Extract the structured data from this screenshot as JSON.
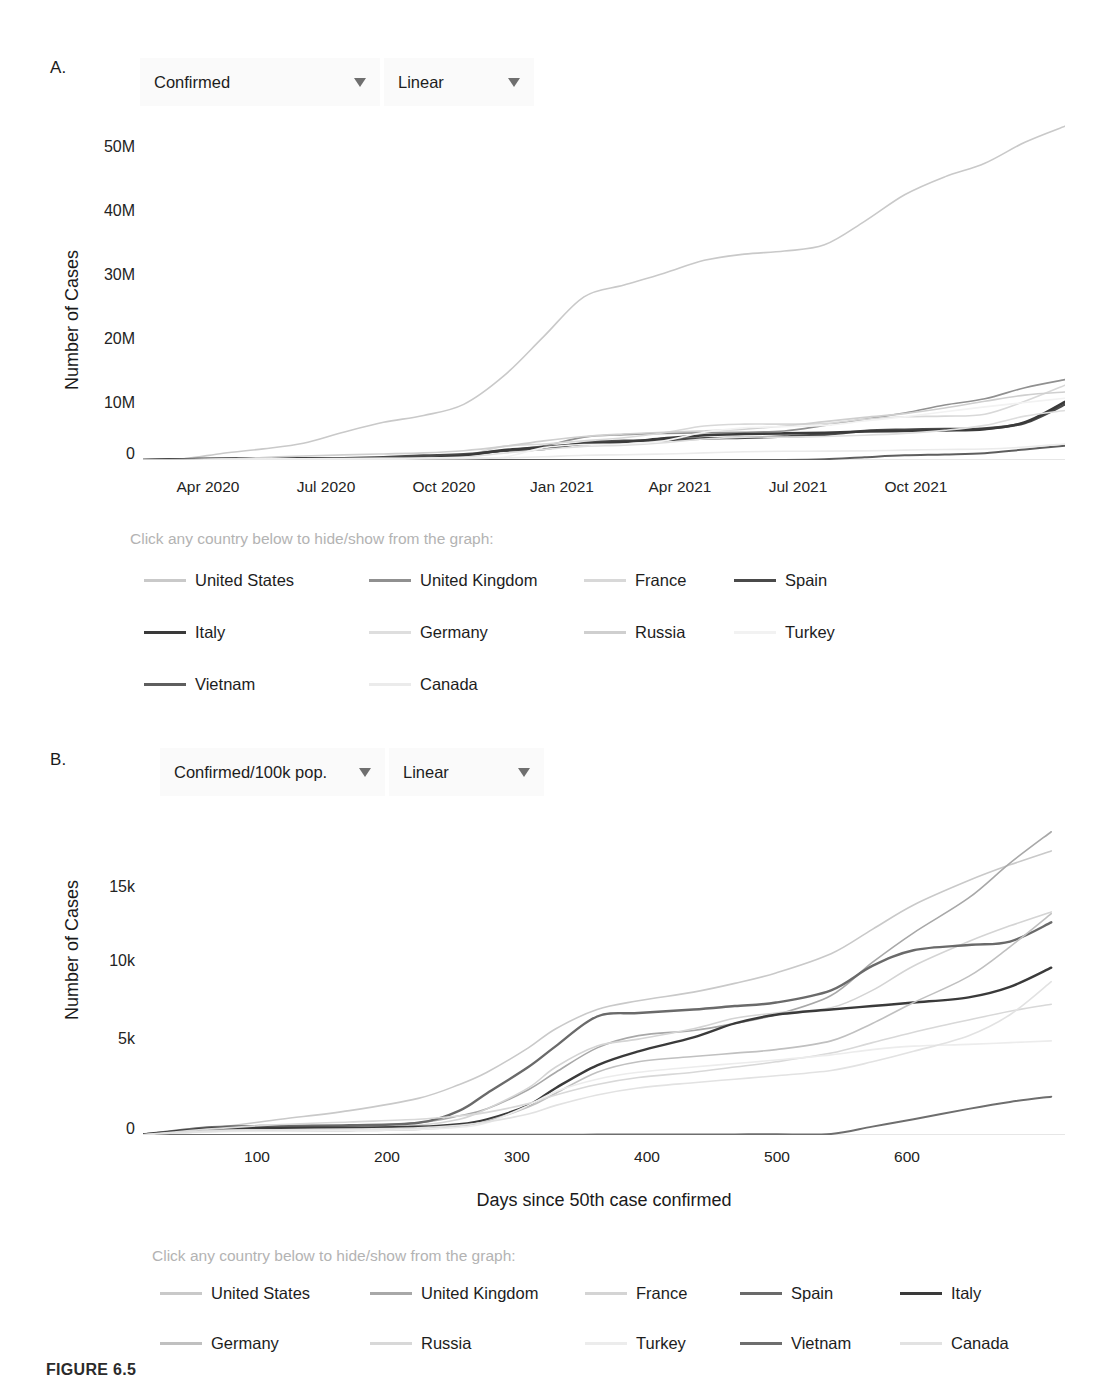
{
  "figure": {
    "caption": "FIGURE 6.5"
  },
  "panel_a": {
    "letter": "A.",
    "controls": [
      {
        "name": "metric-dropdown",
        "value": "Confirmed",
        "caret": "chevron-down-icon"
      },
      {
        "name": "scale-dropdown",
        "value": "Linear",
        "caret": "chevron-down-icon"
      }
    ],
    "legend_hint": "Click any country below to hide/show from the graph:",
    "legend": [
      {
        "label": "United States",
        "color": "#c9c9c9"
      },
      {
        "label": "United Kingdom",
        "color": "#909090"
      },
      {
        "label": "France",
        "color": "#d8d8d8"
      },
      {
        "label": "Spain",
        "color": "#4a4a4a"
      },
      {
        "label": "Italy",
        "color": "#3a3a3a"
      },
      {
        "label": "Germany",
        "color": "#dedede"
      },
      {
        "label": "Russia",
        "color": "#cfcfcf"
      },
      {
        "label": "Turkey",
        "color": "#f2f2f2"
      },
      {
        "label": "Vietnam",
        "color": "#5e5e5e"
      },
      {
        "label": "Canada",
        "color": "#ebebeb"
      }
    ]
  },
  "panel_b": {
    "letter": "B.",
    "controls": [
      {
        "name": "metric-dropdown",
        "value": "Confirmed/100k pop.",
        "caret": "chevron-down-icon"
      },
      {
        "name": "scale-dropdown",
        "value": "Linear",
        "caret": "chevron-down-icon"
      }
    ],
    "legend_hint": "Click any country below to hide/show from the graph:",
    "legend": [
      {
        "label": "United States",
        "color": "#c9c9c9"
      },
      {
        "label": "United Kingdom",
        "color": "#a8a8a8"
      },
      {
        "label": "France",
        "color": "#d4d4d4"
      },
      {
        "label": "Spain",
        "color": "#6a6a6a"
      },
      {
        "label": "Italy",
        "color": "#3a3a3a"
      },
      {
        "label": "Germany",
        "color": "#c0c0c0"
      },
      {
        "label": "Russia",
        "color": "#d8d8d8"
      },
      {
        "label": "Turkey",
        "color": "#ececec"
      },
      {
        "label": "Vietnam",
        "color": "#6e6e6e"
      },
      {
        "label": "Canada",
        "color": "#e2e2e2"
      }
    ]
  },
  "chart_data": [
    {
      "id": "chart-a",
      "type": "line",
      "title": "",
      "xlabel": "",
      "ylabel": "Number of Cases",
      "metric": "Confirmed",
      "scale": "Linear",
      "grid": false,
      "legend_position": "below",
      "xticks": [
        "Apr 2020",
        "Jul 2020",
        "Oct 2020",
        "Jan 2021",
        "Apr 2021",
        "Jul 2021",
        "Oct 2021"
      ],
      "yticks": [
        "0",
        "10M",
        "20M",
        "30M",
        "40M",
        "50M"
      ],
      "ylim": [
        0,
        55000000
      ],
      "x": [
        0,
        1,
        2,
        3,
        4,
        5,
        6,
        7,
        8,
        9,
        10,
        11,
        12,
        13,
        14,
        15,
        16,
        17,
        18,
        19,
        20,
        21,
        22,
        23
      ],
      "x_labels": [
        "Feb 2020",
        "Mar 2020",
        "Apr 2020",
        "May 2020",
        "Jun 2020",
        "Jul 2020",
        "Aug 2020",
        "Sep 2020",
        "Oct 2020",
        "Nov 2020",
        "Dec 2020",
        "Jan 2021",
        "Feb 2021",
        "Mar 2021",
        "Apr 2021",
        "May 2021",
        "Jun 2021",
        "Jul 2021",
        "Aug 2021",
        "Sep 2021",
        "Oct 2021",
        "Nov 2021",
        "Dec 2021",
        "Jan 2022"
      ],
      "series": [
        {
          "name": "United States",
          "color": "#c9c9c9",
          "width": 1.6,
          "values": [
            0.02,
            0.18,
            1.1,
            1.8,
            2.7,
            4.5,
            6.1,
            7.2,
            9.0,
            13.6,
            20.0,
            26.4,
            28.3,
            30.2,
            32.3,
            33.3,
            33.8,
            34.8,
            38.6,
            42.9,
            45.8,
            48.0,
            51.4,
            54.0
          ]
        },
        {
          "name": "United Kingdom",
          "color": "#909090",
          "width": 1.6,
          "values": [
            0.0,
            0.03,
            0.17,
            0.27,
            0.31,
            0.3,
            0.34,
            0.41,
            0.67,
            1.5,
            2.3,
            3.7,
            4.1,
            4.3,
            4.4,
            4.5,
            4.7,
            5.6,
            6.6,
            7.6,
            8.9,
            9.9,
            11.7,
            13.0
          ]
        },
        {
          "name": "France",
          "color": "#d8d8d8",
          "width": 1.6,
          "values": [
            0.0,
            0.04,
            0.13,
            0.15,
            0.2,
            0.21,
            0.3,
            0.56,
            0.75,
            2.2,
            2.6,
            3.1,
            3.6,
            4.4,
            5.5,
            5.8,
            5.8,
            5.9,
            6.6,
            7.0,
            7.1,
            7.4,
            9.5,
            12.1
          ]
        },
        {
          "name": "Spain",
          "color": "#4a4a4a",
          "width": 2.6,
          "values": [
            0.0,
            0.09,
            0.21,
            0.24,
            0.25,
            0.29,
            0.45,
            0.7,
            0.93,
            1.5,
            1.8,
            2.7,
            3.1,
            3.2,
            3.5,
            3.6,
            3.8,
            4.1,
            4.7,
            4.9,
            5.0,
            5.1,
            6.0,
            9.0
          ]
        },
        {
          "name": "Italy",
          "color": "#3a3a3a",
          "width": 2.6,
          "values": [
            0.0,
            0.1,
            0.2,
            0.23,
            0.24,
            0.25,
            0.27,
            0.32,
            0.73,
            1.6,
            2.1,
            2.6,
            2.9,
            3.5,
            4.0,
            4.2,
            4.3,
            4.4,
            4.6,
            4.7,
            4.8,
            5.0,
            6.1,
            9.4
          ]
        },
        {
          "name": "Germany",
          "color": "#dedede",
          "width": 1.6,
          "values": [
            0.0,
            0.06,
            0.16,
            0.18,
            0.19,
            0.21,
            0.24,
            0.28,
            0.46,
            1.1,
            1.7,
            2.2,
            2.4,
            2.8,
            3.4,
            3.7,
            3.7,
            3.8,
            4.0,
            4.3,
            4.8,
            5.6,
            7.1,
            8.0
          ]
        },
        {
          "name": "Russia",
          "color": "#cfcfcf",
          "width": 1.6,
          "values": [
            0.0,
            0.002,
            0.11,
            0.41,
            0.65,
            0.83,
            0.98,
            1.15,
            1.5,
            2.2,
            3.1,
            3.8,
            4.2,
            4.5,
            4.7,
            5.0,
            5.5,
            6.2,
            6.9,
            7.5,
            8.4,
            9.5,
            10.5,
            11.0
          ]
        },
        {
          "name": "Turkey",
          "color": "#f2f2f2",
          "width": 1.6,
          "values": [
            0.0,
            0.01,
            0.12,
            0.16,
            0.2,
            0.23,
            0.26,
            0.31,
            0.37,
            0.45,
            2.0,
            2.5,
            2.6,
            3.1,
            4.5,
            5.2,
            5.4,
            5.6,
            6.3,
            7.0,
            7.8,
            8.6,
            9.3,
            10.0
          ]
        },
        {
          "name": "Vietnam",
          "color": "#5e5e5e",
          "width": 2.0,
          "values": [
            0.0,
            0.0,
            0.0003,
            0.0003,
            0.0004,
            0.0004,
            0.001,
            0.001,
            0.001,
            0.0013,
            0.0015,
            0.0018,
            0.0024,
            0.0026,
            0.003,
            0.007,
            0.017,
            0.13,
            0.45,
            0.75,
            0.9,
            1.1,
            1.7,
            2.3
          ]
        },
        {
          "name": "Canada",
          "color": "#ebebeb",
          "width": 1.6,
          "values": [
            0.0,
            0.009,
            0.055,
            0.09,
            0.105,
            0.117,
            0.13,
            0.15,
            0.21,
            0.33,
            0.53,
            0.77,
            0.86,
            0.97,
            1.15,
            1.33,
            1.41,
            1.43,
            1.47,
            1.6,
            1.7,
            1.78,
            2.1,
            2.6
          ]
        }
      ],
      "value_units": "millions"
    },
    {
      "id": "chart-b",
      "type": "line",
      "title": "",
      "xlabel": "Days since 50th case confirmed",
      "ylabel": "Number of Cases",
      "metric": "Confirmed/100k pop.",
      "scale": "Linear",
      "grid": false,
      "legend_position": "below",
      "xticks": [
        "100",
        "200",
        "300",
        "400",
        "500",
        "600"
      ],
      "yticks": [
        "0",
        "5k",
        "10k",
        "15k"
      ],
      "xlim": [
        0,
        670
      ],
      "ylim": [
        0,
        17500
      ],
      "x": [
        0,
        50,
        100,
        150,
        200,
        230,
        250,
        280,
        300,
        330,
        360,
        400,
        430,
        460,
        500,
        530,
        560,
        600,
        630,
        660
      ],
      "series": [
        {
          "name": "United States",
          "color": "#c9c9c9",
          "width": 1.6,
          "values": [
            20,
            400,
            900,
            1400,
            2100,
            2900,
            3600,
            5000,
            6100,
            7200,
            7700,
            8200,
            8700,
            9300,
            10400,
            11800,
            13200,
            14600,
            15500,
            16300
          ]
        },
        {
          "name": "United Kingdom",
          "color": "#a8a8a8",
          "width": 1.6,
          "values": [
            20,
            300,
            450,
            520,
            700,
            1100,
            1500,
            2600,
            3600,
            5000,
            5700,
            6000,
            6400,
            6900,
            8000,
            9900,
            11600,
            13600,
            15600,
            17400
          ]
        },
        {
          "name": "France",
          "color": "#d4d4d4",
          "width": 1.6,
          "values": [
            20,
            250,
            330,
            400,
            560,
            900,
            1500,
            2700,
            3900,
            5100,
            5500,
            6100,
            6700,
            7000,
            7300,
            8300,
            9700,
            11100,
            12000,
            12800
          ]
        },
        {
          "name": "Spain",
          "color": "#6a6a6a",
          "width": 2.4,
          "values": [
            30,
            450,
            520,
            560,
            700,
            1400,
            2400,
            3900,
            5100,
            6800,
            7000,
            7200,
            7400,
            7600,
            8300,
            9700,
            10600,
            10900,
            11100,
            12200
          ]
        },
        {
          "name": "Italy",
          "color": "#3a3a3a",
          "width": 2.4,
          "values": [
            25,
            380,
            410,
            420,
            470,
            620,
            900,
            1700,
            2700,
            4000,
            4800,
            5600,
            6400,
            6900,
            7200,
            7400,
            7600,
            7900,
            8500,
            9600
          ]
        },
        {
          "name": "Germany",
          "color": "#c0c0c0",
          "width": 1.6,
          "values": [
            15,
            210,
            230,
            250,
            320,
            500,
            800,
            1600,
            2400,
            3600,
            4200,
            4500,
            4700,
            4900,
            5400,
            6400,
            7600,
            9100,
            10800,
            12700
          ]
        },
        {
          "name": "Russia",
          "color": "#d8d8d8",
          "width": 1.6,
          "values": [
            10,
            350,
            600,
            750,
            900,
            1100,
            1300,
            1800,
            2300,
            2900,
            3300,
            3600,
            3900,
            4200,
            4700,
            5300,
            5900,
            6600,
            7100,
            7500
          ]
        },
        {
          "name": "Turkey",
          "color": "#ececec",
          "width": 1.6,
          "values": [
            10,
            180,
            220,
            260,
            320,
            450,
            700,
            1700,
            2500,
            3200,
            3600,
            3900,
            4100,
            4300,
            4600,
            4900,
            5100,
            5200,
            5300,
            5400
          ]
        },
        {
          "name": "Vietnam",
          "color": "#6e6e6e",
          "width": 2.0,
          "values": [
            2,
            3,
            4,
            5,
            8,
            10,
            12,
            15,
            18,
            22,
            26,
            30,
            35,
            40,
            60,
            480,
            900,
            1500,
            1900,
            2200
          ]
        },
        {
          "name": "Canada",
          "color": "#e2e2e2",
          "width": 1.6,
          "values": [
            10,
            220,
            300,
            340,
            420,
            560,
            750,
            1200,
            1700,
            2300,
            2700,
            3000,
            3200,
            3400,
            3700,
            4200,
            4800,
            5700,
            6900,
            8800
          ]
        }
      ],
      "value_units": "cases per 100k population"
    }
  ]
}
